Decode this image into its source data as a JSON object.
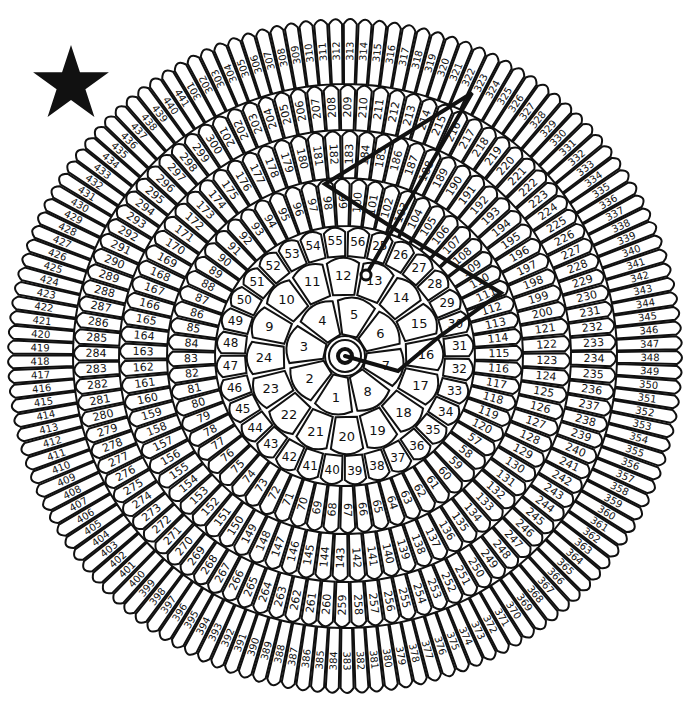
{
  "puzzle": {
    "type": "dot-to-dot",
    "highest_number": 441,
    "completion_marker": "star-icon",
    "center": {
      "x": 345,
      "y": 356
    },
    "colors": {
      "ink": "#111111",
      "paper": "#ffffff"
    },
    "center_label": "1",
    "rings": [
      {
        "name": "ring-0",
        "from": 1,
        "to": 8,
        "r_in": 22,
        "r_out": 62,
        "start_angle": 80,
        "font": 13
      },
      {
        "name": "ring-1",
        "from": 9,
        "to": 24,
        "r_in": 62,
        "r_out": 100,
        "start_angle": 190,
        "font": 13
      },
      {
        "name": "ring-2",
        "from": 25,
        "to": 56,
        "r_in": 100,
        "r_out": 130,
        "start_angle": -78,
        "font": 12
      },
      {
        "name": "ring-3",
        "from": 57,
        "to": 120,
        "r_in": 130,
        "r_out": 178,
        "start_angle": 30,
        "font": 11
      },
      {
        "name": "ring-4",
        "from": 121,
        "to": 200,
        "r_in": 178,
        "r_out": 226,
        "start_angle": -10,
        "font": 11
      },
      {
        "name": "ring-5",
        "from": 201,
        "to": 300,
        "r_in": 226,
        "r_out": 272,
        "start_angle": -120,
        "font": 11
      },
      {
        "name": "ring-6",
        "from": 301,
        "to": 441,
        "r_in": 272,
        "r_out": 338,
        "start_angle": -121,
        "font": 10
      }
    ],
    "drawn_path": {
      "label": "connected-dots",
      "points": [
        {
          "n": "1",
          "x": 345,
          "y": 356
        },
        {
          "n": "6",
          "x": 398,
          "y": 371
        },
        {
          "n": "29",
          "x": 440,
          "y": 336
        },
        {
          "n": "91",
          "x": 501,
          "y": 293
        },
        {
          "n": "48",
          "x": 393,
          "y": 228
        },
        {
          "n": "81",
          "x": 325,
          "y": 184
        },
        {
          "n": "326",
          "x": 472,
          "y": 93
        },
        {
          "n": "12",
          "x": 366,
          "y": 275
        }
      ],
      "current_dot": "12"
    }
  }
}
